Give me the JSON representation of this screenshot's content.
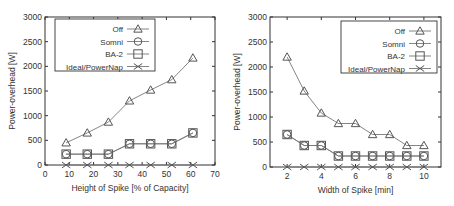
{
  "chart_data": [
    {
      "type": "line",
      "title": "",
      "xlabel": "Height of Spike [% of Capacity]",
      "ylabel": "Power-overhead [W]",
      "xlim": [
        0,
        70
      ],
      "ylim": [
        0,
        3000
      ],
      "xticks": [
        0,
        10,
        20,
        30,
        40,
        50,
        60,
        70
      ],
      "yticks": [
        0,
        500,
        1000,
        1500,
        2000,
        2500,
        3000
      ],
      "grid": false,
      "legend_position": "upper-left",
      "x": [
        8.7,
        17.4,
        26.1,
        34.8,
        43.5,
        52.2,
        60.9
      ],
      "series": [
        {
          "name": "Off",
          "marker": "triangle",
          "values": [
            450,
            650,
            870,
            1300,
            1520,
            1730,
            2170
          ]
        },
        {
          "name": "Somni",
          "marker": "circle",
          "values": [
            220,
            220,
            220,
            430,
            430,
            430,
            650
          ]
        },
        {
          "name": "BA-2",
          "marker": "square",
          "values": [
            220,
            220,
            220,
            430,
            430,
            430,
            650
          ]
        },
        {
          "name": "Ideal/PowerNap",
          "marker": "x",
          "values": [
            0,
            0,
            0,
            0,
            0,
            0,
            0
          ]
        }
      ]
    },
    {
      "type": "line",
      "title": "",
      "xlabel": "Width of Spike [min]",
      "ylabel": "Power-overhead [W]",
      "xlim": [
        1,
        11
      ],
      "ylim": [
        0,
        3000
      ],
      "xticks": [
        2,
        4,
        6,
        8,
        10
      ],
      "yticks": [
        0,
        500,
        1000,
        1500,
        2000,
        2500,
        3000
      ],
      "grid": false,
      "legend_position": "upper-right",
      "x": [
        2,
        3,
        4,
        5,
        6,
        7,
        8,
        9,
        10
      ],
      "series": [
        {
          "name": "Off",
          "marker": "triangle",
          "values": [
            2200,
            1520,
            1080,
            870,
            870,
            650,
            650,
            430,
            430
          ]
        },
        {
          "name": "Somni",
          "marker": "circle",
          "values": [
            650,
            430,
            430,
            220,
            220,
            220,
            220,
            220,
            220
          ]
        },
        {
          "name": "BA-2",
          "marker": "square",
          "values": [
            650,
            430,
            430,
            220,
            220,
            220,
            220,
            220,
            220
          ]
        },
        {
          "name": "Ideal/PowerNap",
          "marker": "x",
          "values": [
            0,
            0,
            0,
            0,
            0,
            0,
            0,
            0,
            0
          ]
        }
      ]
    }
  ]
}
